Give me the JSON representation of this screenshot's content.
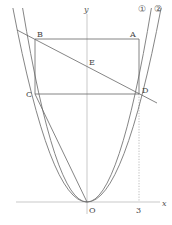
{
  "figure": {
    "axes": {
      "x_label": "x",
      "y_label": "y",
      "origin_label": "O",
      "tick_label_x": "3",
      "axis_color": "#bbbbbb"
    },
    "curves": [
      {
        "label": "①",
        "description": "parabola through A and B (narrower)"
      },
      {
        "label": "②",
        "description": "parabola through C and D (wider)"
      }
    ],
    "points": {
      "A": "A",
      "B": "B",
      "C": "C",
      "D": "D",
      "E": "E"
    },
    "line_color": "#666666",
    "curve_color": "#777777"
  }
}
